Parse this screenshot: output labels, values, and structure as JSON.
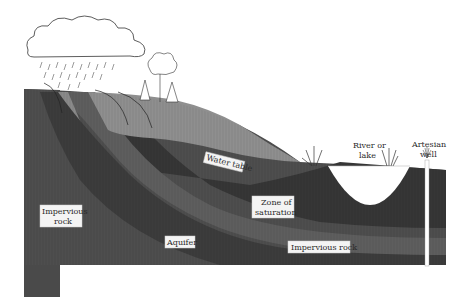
{
  "diagram": {
    "type": "groundwater cross-section",
    "labels": {
      "water_table": "Water table",
      "river_or_lake_1": "River or",
      "river_or_lake_2": "lake",
      "artesian_well_1": "Artesian",
      "artesian_well_2": "well",
      "zone_of_saturation_1": "Zone of",
      "zone_of_saturation_2": "saturation",
      "impervious_rock_left_1": "Impervious",
      "impervious_rock_left_2": "rock",
      "aquifer": "Aquifer",
      "impervious_rock_bottom": "Impervious rock"
    },
    "icons": [
      "rain-cloud-icon",
      "rain-icon",
      "tree-icon",
      "grass-icon",
      "well-spray-icon",
      "infiltration-arrow-icon"
    ],
    "colors": {
      "background": "#ffffff",
      "unsaturated_zone": "#8e8e8e",
      "saturated_zone": "#3a3a3a",
      "impervious_rock": "#4e4e4e",
      "aquifer_band": "#6e6e6e",
      "label_box": "#f4f4f4",
      "water": "#ffffff"
    }
  }
}
